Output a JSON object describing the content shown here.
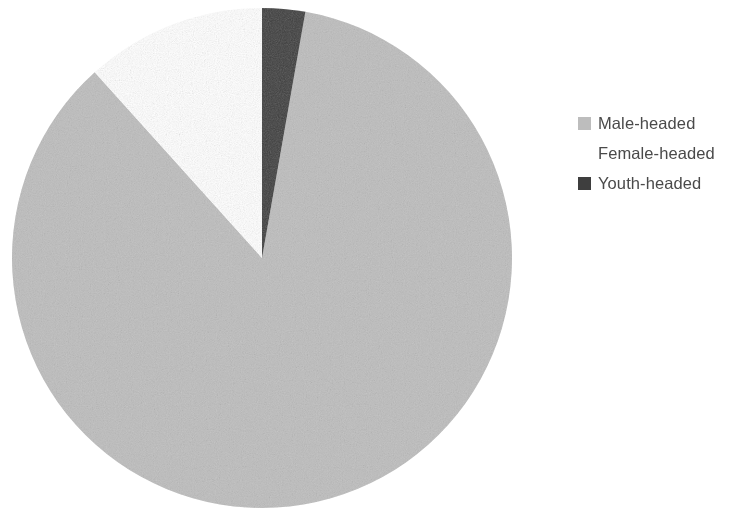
{
  "chart_data": {
    "type": "pie",
    "title": "",
    "subtitle": "",
    "xlabel": "",
    "ylabel": "",
    "grid": false,
    "legend_position": "right",
    "start_angle_deg": 0,
    "direction": "clockwise",
    "categories": [
      "Male-headed",
      "Female-headed",
      "Youth-headed"
    ],
    "values": [
      85.5,
      11.5,
      3.0
    ],
    "value_unit": "percent",
    "slices": [
      {
        "label": "Male-headed",
        "value": 85.5,
        "color": "#bdbdbd",
        "start_angle_deg": 10,
        "end_angle_deg": 318
      },
      {
        "label": "Female-headed",
        "value": 11.5,
        "color": "#ffffff",
        "start_angle_deg": 318,
        "end_angle_deg": 360
      },
      {
        "label": "Youth-headed",
        "value": 3.0,
        "color": "#3e3e3e",
        "start_angle_deg": 0,
        "end_angle_deg": 10
      }
    ],
    "annotations": []
  },
  "legend": {
    "items": [
      {
        "label": "Male-headed",
        "swatch_color": "#bdbdbd",
        "swatch_visible": true
      },
      {
        "label": "Female-headed",
        "swatch_color": "#ffffff",
        "swatch_visible": false
      },
      {
        "label": "Youth-headed",
        "swatch_color": "#3e3e3e",
        "swatch_visible": true
      }
    ]
  },
  "canvas": {
    "background_color": "#ffffff",
    "pie_center_x": 262,
    "pie_center_y": 258,
    "pie_radius": 250
  }
}
